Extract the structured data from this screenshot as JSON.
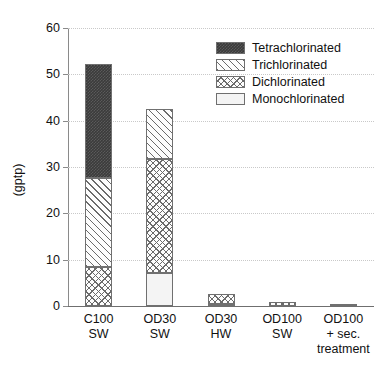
{
  "chart_data": {
    "type": "bar",
    "subtype": "stacked-bar",
    "title": "",
    "xlabel": "",
    "ylabel": "(gptp)",
    "ylim": [
      0,
      60
    ],
    "yticks": [
      0,
      10,
      20,
      30,
      40,
      50,
      60
    ],
    "ytick_labels": [
      "0",
      "10",
      "20",
      "30",
      "40",
      "50",
      "60"
    ],
    "grid": true,
    "grid_axis": "y",
    "grid_style": "dotted",
    "legend_position": "upper right",
    "categories": [
      "C100 SW",
      "OD30 SW",
      "OD30 HW",
      "OD100 SW",
      "OD100 + sec. treatment"
    ],
    "category_lines": [
      [
        "C100",
        "SW"
      ],
      [
        "OD30",
        "SW"
      ],
      [
        "OD30",
        "HW"
      ],
      [
        "OD100",
        "SW"
      ],
      [
        "OD100",
        "+ sec.",
        "treatment"
      ]
    ],
    "series": [
      {
        "name": "Monochlorinated",
        "pattern": "solid-white",
        "color": "#f4f4f4",
        "values": [
          0,
          7.2,
          0.5,
          0,
          0
        ]
      },
      {
        "name": "Dichlorinated",
        "pattern": "crosshatch",
        "color": "#fdfdfd",
        "values": [
          8.5,
          24.6,
          2.0,
          0.9,
          0
        ]
      },
      {
        "name": "Trichlorinated",
        "pattern": "diagonal-hatch",
        "color": "#fdfdfd",
        "values": [
          19.2,
          10.7,
          0,
          0,
          0
        ]
      },
      {
        "name": "Tetrachlorinated",
        "pattern": "dense-dark",
        "color": "#3b3b3b",
        "values": [
          24.6,
          0,
          0,
          0,
          0
        ]
      }
    ],
    "totals": [
      52.3,
      42.5,
      2.5,
      0.9,
      0.05
    ]
  },
  "legend": {
    "entries": [
      {
        "label": "Tetrachlorinated",
        "swatch": "dense-dark-swatch"
      },
      {
        "label": "Trichlorinated",
        "swatch": "diagonal-hatch-swatch"
      },
      {
        "label": "Dichlorinated",
        "swatch": "crosshatch-swatch"
      },
      {
        "label": "Monochlorinated",
        "swatch": "white-swatch"
      }
    ]
  },
  "axes": {
    "y_title": "(gptp)",
    "y_tick_0": "0",
    "y_tick_1": "10",
    "y_tick_2": "20",
    "y_tick_3": "30",
    "y_tick_4": "40",
    "y_tick_5": "50",
    "y_tick_6": "60"
  }
}
